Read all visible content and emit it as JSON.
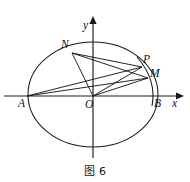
{
  "figure": {
    "caption": "图 6",
    "axes": {
      "x_label": "x",
      "y_label": "y",
      "origin_label": "O"
    },
    "points": [
      {
        "name": "A",
        "label": "A",
        "x": 27,
        "y": 96,
        "label_x": 18,
        "label_y": 98,
        "role": "left-vertex"
      },
      {
        "name": "B",
        "label": "B",
        "x": 158,
        "y": 96,
        "label_x": 154,
        "label_y": 98,
        "role": "right-vertex"
      },
      {
        "name": "O",
        "label": "O",
        "x": 93,
        "y": 96,
        "label_x": 85,
        "label_y": 99,
        "role": "origin"
      },
      {
        "name": "N",
        "label": "N",
        "x": 72,
        "y": 53,
        "label_x": 61,
        "label_y": 39,
        "role": "upper-left-on-ellipse"
      },
      {
        "name": "P",
        "label": "P",
        "x": 142,
        "y": 67,
        "label_x": 143,
        "label_y": 54,
        "role": "upper-right-on-ellipse"
      },
      {
        "name": "M",
        "label": "M",
        "x": 148,
        "y": 78,
        "label_x": 150,
        "label_y": 68,
        "role": "right-intersection"
      }
    ],
    "ellipse": {
      "cx": 93,
      "cy": 94.5,
      "rx": 65,
      "ry": 52.5
    },
    "small_arc": {
      "description": "short arc through P and M near B",
      "from_x": 137,
      "from_y": 57,
      "to_x": 152,
      "to_y": 104,
      "ctrl_x": 156,
      "ctrl_y": 80
    },
    "segments": [
      {
        "from": "N",
        "to": "O"
      },
      {
        "from": "N",
        "to": "P"
      },
      {
        "from": "N",
        "to": "M"
      },
      {
        "from": "A",
        "to": "P"
      },
      {
        "from": "A",
        "to": "M"
      },
      {
        "from": "O",
        "to": "P"
      },
      {
        "from": "O",
        "to": "M"
      }
    ],
    "colors": {
      "ink": "#1a1a1a",
      "background": "#ffffff"
    }
  }
}
